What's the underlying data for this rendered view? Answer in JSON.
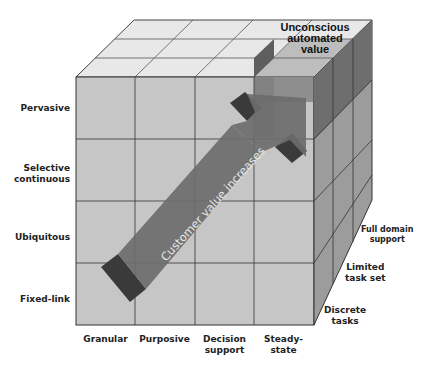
{
  "diagram": {
    "type": "3d-cube-matrix",
    "rows": [
      "Pervasive",
      "Selective continuous",
      "Ubiquitous",
      "Fixed-link"
    ],
    "columns": [
      "Granular",
      "Purposive",
      "Decision support",
      "Steady-state"
    ],
    "depth": [
      "Discrete tasks",
      "Limited task set",
      "Full domain support"
    ],
    "highlight_label": "Unconscious automated value",
    "arrow_label": "Customer value increases",
    "colors": {
      "front_face": "#c6c6c6",
      "top_face": "#e8e8e8",
      "side_face": "#9c9c9c",
      "highlight_front": "#8c8c8c",
      "highlight_top": "#6a6a6a",
      "highlight_side": "#6e6e6e",
      "arrow": "#6c6c6c",
      "arrow_dark": "#3a3a3a",
      "grid_line": "#333333"
    }
  },
  "labels": {
    "rows": {
      "r0": "Pervasive",
      "r1a": "Selective",
      "r1b": "continuous",
      "r2": "Ubiquitous",
      "r3": "Fixed-link"
    },
    "cols": {
      "c0": "Granular",
      "c1": "Purposive",
      "c2a": "Decision",
      "c2b": "support",
      "c3a": "Steady-",
      "c3b": "state"
    },
    "depth": {
      "d0a": "Discrete",
      "d0b": "tasks",
      "d1a": "Limited",
      "d1b": "task set",
      "d2a": "Full domain",
      "d2b": "support"
    },
    "highlight": {
      "l1": "Unconscious",
      "l2": "automated",
      "l3": "value"
    },
    "arrow": "Customer value increases"
  }
}
